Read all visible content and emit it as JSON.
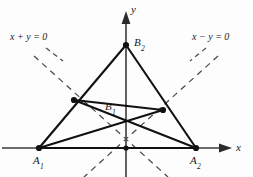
{
  "figure": {
    "kind": "geometry-diagram",
    "width": 253,
    "height": 177,
    "background_color": "#fdfdfd",
    "stroke_color": "#111111",
    "axis_color": "#3a3a3a",
    "dash_color": "#444444"
  },
  "axes": {
    "x_label": "x",
    "y_label": "y",
    "origin": {
      "x": 126,
      "y": 148
    }
  },
  "points": [
    {
      "id": "A1",
      "base": "A",
      "sub": "1",
      "x": 39,
      "y": 148,
      "label_dx": -6,
      "label_dy": 9,
      "dot": true
    },
    {
      "id": "A2",
      "base": "A",
      "sub": "2",
      "x": 196,
      "y": 148,
      "label_dx": -6,
      "label_dy": 9,
      "dot": true
    },
    {
      "id": "B2",
      "base": "B",
      "sub": "2",
      "x": 126,
      "y": 45,
      "label_dx": 7,
      "label_dy": -9,
      "dot": true
    },
    {
      "id": "B1",
      "base": "B",
      "sub": "1",
      "x": 124,
      "y": 122,
      "label_dx": -17,
      "label_dy": -17,
      "dot": false
    },
    {
      "id": "M1",
      "base": "",
      "sub": "",
      "x": 74,
      "y": 100,
      "label_dx": 0,
      "label_dy": 0,
      "dot": true
    },
    {
      "id": "M2",
      "base": "",
      "sub": "",
      "x": 163,
      "y": 110,
      "label_dx": 0,
      "label_dy": 0,
      "dot": true
    }
  ],
  "equations": [
    {
      "id": "left-line",
      "text_parts": [
        "x",
        " + ",
        "y",
        " = 0"
      ],
      "text": "x + y = 0",
      "label_x": 10,
      "label_y": 38
    },
    {
      "id": "right-line",
      "text_parts": [
        "x",
        " − ",
        "y",
        " = 0"
      ],
      "text": "x − y = 0",
      "label_x": 192,
      "label_y": 38
    }
  ],
  "solid_segments": [
    {
      "from": "A1",
      "to": "B2",
      "note": "left side of outer triangle through M1"
    },
    {
      "from": "B2",
      "to": "A2",
      "note": "right side of outer triangle through M2"
    },
    {
      "from": "A1",
      "to": "A2",
      "note": "base of outer triangle on x-axis"
    },
    {
      "from": "M1",
      "to": "A2",
      "note": "cevian from left midpoint to A2"
    },
    {
      "from": "M2",
      "to": "A1",
      "note": "cevian from right midpoint to A1"
    },
    {
      "from": "M1",
      "to": "M2",
      "note": "midline segment through B1"
    }
  ],
  "dashed_lines": [
    {
      "id": "x-plus-y",
      "x1": 34,
      "y1": 56,
      "x2": 168,
      "y2": 177,
      "note": "line x + y = 0 direction through origin"
    },
    {
      "id": "x-minus-y",
      "x1": 218,
      "y1": 56,
      "x2": 84,
      "y2": 177,
      "note": "line x - y = 0 direction through origin"
    }
  ],
  "leaders": [
    {
      "id": "left-leader",
      "x1": 46,
      "y1": 48,
      "x2": 64,
      "y2": 62
    },
    {
      "id": "right-leader",
      "x1": 206,
      "y1": 48,
      "x2": 190,
      "y2": 62
    }
  ]
}
